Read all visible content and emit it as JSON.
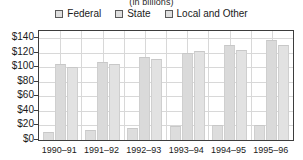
{
  "chart_data": {
    "type": "bar",
    "title": "(in billions)",
    "xlabel": "",
    "ylabel": "",
    "ylim": [
      0,
      150
    ],
    "ytick_values": [
      0,
      20,
      40,
      60,
      80,
      100,
      120,
      140
    ],
    "ytick_labels": [
      "$0",
      "$20",
      "$40",
      "$60",
      "$80",
      "$100",
      "$120",
      "$140"
    ],
    "grid": true,
    "legend_position": "top",
    "categories": [
      "1990–91",
      "1991–92",
      "1992–93",
      "1993–94",
      "1994–95",
      "1995–96"
    ],
    "series": [
      {
        "name": "Federal",
        "color": "#dddddd",
        "values": [
          11,
          14,
          17,
          19,
          21,
          21
        ]
      },
      {
        "name": "State",
        "color": "#dadada",
        "values": [
          105,
          108,
          114,
          120,
          131,
          137
        ]
      },
      {
        "name": "Local and Other",
        "color": "#e2e2e2",
        "values": [
          100,
          105,
          112,
          122,
          124,
          131
        ]
      }
    ]
  },
  "legend": {
    "items": [
      {
        "label": "Federal"
      },
      {
        "label": "State"
      },
      {
        "label": "Local and Other"
      }
    ]
  },
  "colors": {
    "bar_fill": "#dcdcdc",
    "bar_edge": "#cfcfcf",
    "grid": "#d8d8d8",
    "axis": "#3d3d3d",
    "text": "#1a1a1a",
    "background": "#ffffff"
  }
}
